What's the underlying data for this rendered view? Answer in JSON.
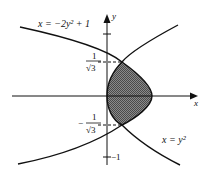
{
  "diagram": {
    "curves": [
      {
        "equation_label": "x = −2y² + 1"
      },
      {
        "equation_label": "x = y²"
      }
    ],
    "axes": {
      "x_label": "x",
      "y_label": "y"
    },
    "ticks": {
      "y_top_numerator": "1",
      "y_top_denominator": "√3",
      "y_bottom_sign": "−",
      "y_bottom_numerator": "1",
      "y_bottom_denominator": "√3",
      "y_minus_one": "−1"
    },
    "colors": {
      "line": "#111111",
      "shade": "#6b6b6b",
      "background": "#ffffff"
    }
  }
}
